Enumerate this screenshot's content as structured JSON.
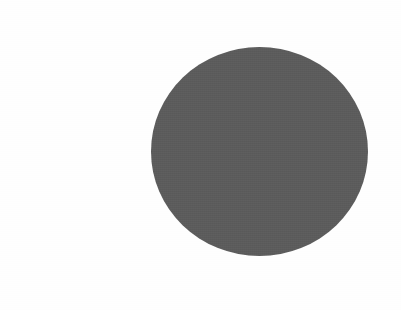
{
  "canvas": {
    "width": 401,
    "height": 310,
    "background_color": "#fefefe"
  },
  "chart_data": {
    "type": "scatter",
    "title": "",
    "subtitle": "",
    "xlabel": "",
    "ylabel": "",
    "grid": false,
    "legend_position": "none",
    "axes_visible": false,
    "tick_labels": {
      "x": [],
      "y": []
    },
    "annotations": [],
    "series": [
      {
        "name": "disc",
        "marker": "circle",
        "color": "#5c5c5c",
        "edge_color": "none",
        "opacity": 1,
        "points": [
          {
            "label": "",
            "center_x": 259.5,
            "center_y": 151.5,
            "radius_x": 108.5,
            "radius_y": 104.5,
            "diameter_x": 217,
            "diameter_y": 209
          }
        ]
      }
    ]
  },
  "shapes": [
    {
      "kind": "ellipse",
      "name": "gray-disc",
      "fill": "#5c5c5c",
      "stroke": "none",
      "stroke_width": 0,
      "cx": 259.5,
      "cy": 151.5,
      "rx": 108.5,
      "ry": 104.5,
      "bounds": {
        "left": 151,
        "top": 47,
        "right": 368,
        "bottom": 256
      }
    }
  ],
  "palette": {
    "shape_fill": "#5c5c5c",
    "background": "#fefefe"
  },
  "text_content": []
}
